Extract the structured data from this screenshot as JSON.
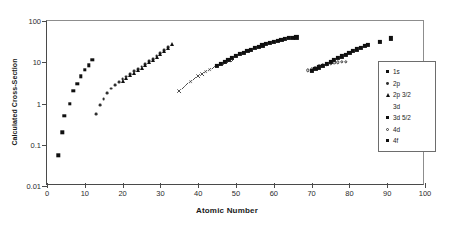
{
  "chart_data": {
    "type": "scatter",
    "title": "",
    "xlabel": "Atomic Number",
    "ylabel": "Calculated Cross-Section",
    "xlim": [
      0,
      100
    ],
    "ylim": [
      0.01,
      100
    ],
    "yscale": "log",
    "xscale": "linear",
    "grid": false,
    "legend_position": "right",
    "xticks": [
      "0",
      "10",
      "20",
      "30",
      "40",
      "50",
      "60",
      "70",
      "80",
      "90",
      "100"
    ],
    "xtick_values": [
      0,
      10,
      20,
      30,
      40,
      50,
      60,
      70,
      80,
      90,
      100
    ],
    "yticks": [
      "0.01",
      "0.1",
      "1",
      "10",
      "100"
    ],
    "ytick_values": [
      0.01,
      0.1,
      1,
      10,
      100
    ],
    "series": [
      {
        "name": "1s",
        "marker": "filled-square",
        "points": [
          [
            3,
            0.055
          ],
          [
            4,
            0.2
          ],
          [
            4.6,
            0.5
          ],
          [
            6,
            1.0
          ],
          [
            7,
            2.0
          ],
          [
            8,
            3.0
          ],
          [
            9,
            4.6
          ],
          [
            10,
            6.5
          ],
          [
            11,
            8.5
          ],
          [
            12,
            11.5
          ]
        ]
      },
      {
        "name": "2p",
        "marker": "small-dot",
        "points": [
          [
            13,
            0.55
          ],
          [
            14,
            0.9
          ],
          [
            15,
            1.3
          ],
          [
            16,
            1.8
          ],
          [
            17,
            2.3
          ],
          [
            18,
            2.8
          ],
          [
            19,
            3.3
          ],
          [
            20,
            3.9
          ],
          [
            21,
            4.5
          ],
          [
            22,
            5.2
          ],
          [
            23,
            6.0
          ],
          [
            24,
            6.8
          ],
          [
            25,
            7.8
          ],
          [
            26,
            9.0
          ],
          [
            27,
            10.5
          ],
          [
            28,
            12.0
          ],
          [
            29,
            14.0
          ],
          [
            30,
            16.5
          ],
          [
            31,
            19.5
          ],
          [
            32,
            23.0
          ]
        ]
      },
      {
        "name": "2p 3/2",
        "marker": "filled-triangle",
        "points": [
          [
            20,
            3.6
          ],
          [
            21,
            4.2
          ],
          [
            22,
            4.9
          ],
          [
            23,
            5.6
          ],
          [
            24,
            6.4
          ],
          [
            25,
            7.3
          ],
          [
            26,
            8.5
          ],
          [
            27,
            10.0
          ],
          [
            28,
            11.5
          ],
          [
            29,
            13.5
          ],
          [
            30,
            16.0
          ],
          [
            31,
            19.0
          ],
          [
            32,
            22.0
          ],
          [
            33,
            27.0
          ]
        ]
      },
      {
        "name": "3d",
        "marker": "x-cross",
        "points": [
          [
            35,
            2.0
          ],
          [
            36,
            2.4
          ],
          [
            37,
            2.9
          ],
          [
            38,
            3.4
          ],
          [
            39,
            4.0
          ],
          [
            40,
            4.6
          ],
          [
            41,
            5.2
          ],
          [
            42,
            5.9
          ],
          [
            43,
            6.6
          ],
          [
            44,
            7.4
          ],
          [
            45,
            8.2
          ],
          [
            46,
            9.0
          ],
          [
            47,
            9.6
          ],
          [
            48,
            10.2
          ],
          [
            49,
            10.8
          ]
        ]
      },
      {
        "name": "3d 5/2",
        "marker": "filled-square",
        "points": [
          [
            45,
            8.2
          ],
          [
            46,
            9.2
          ],
          [
            47,
            10.3
          ],
          [
            48,
            11.5
          ],
          [
            49,
            12.8
          ],
          [
            50,
            14.2
          ],
          [
            51,
            15.6
          ],
          [
            52,
            17.0
          ],
          [
            53,
            18.6
          ],
          [
            54,
            20.2
          ],
          [
            55,
            22.0
          ],
          [
            56,
            23.8
          ],
          [
            57,
            25.6
          ],
          [
            58,
            27.4
          ],
          [
            59,
            29.5
          ],
          [
            60,
            31.5
          ],
          [
            61,
            33.5
          ],
          [
            62,
            35.5
          ],
          [
            63,
            37.0
          ],
          [
            64,
            38.5
          ],
          [
            65,
            39.5
          ],
          [
            66,
            40.0
          ]
        ]
      },
      {
        "name": "4d",
        "marker": "open-circle",
        "points": [
          [
            69,
            6.4
          ],
          [
            70,
            6.9
          ],
          [
            71,
            7.4
          ],
          [
            72,
            7.9
          ],
          [
            73,
            8.4
          ],
          [
            74,
            8.8
          ],
          [
            75,
            9.2
          ],
          [
            76,
            9.6
          ],
          [
            77,
            9.9
          ],
          [
            78,
            10.2
          ],
          [
            79,
            10.4
          ]
        ]
      },
      {
        "name": "4f",
        "marker": "filled-square",
        "points": [
          [
            70,
            6.2
          ],
          [
            71,
            6.8
          ],
          [
            72,
            7.5
          ],
          [
            73,
            8.3
          ],
          [
            74,
            9.2
          ],
          [
            75,
            10.2
          ],
          [
            76,
            11.3
          ],
          [
            77,
            12.5
          ],
          [
            78,
            13.8
          ],
          [
            79,
            15.2
          ],
          [
            80,
            16.8
          ],
          [
            81,
            18.5
          ],
          [
            82,
            20.5
          ],
          [
            83,
            22.5
          ],
          [
            84,
            24.5
          ],
          [
            85,
            26.5
          ],
          [
            88,
            31.0
          ],
          [
            91,
            38.0
          ]
        ]
      }
    ]
  },
  "legend": {
    "items": [
      {
        "label": "1s",
        "marker": "filled-square"
      },
      {
        "label": "2p",
        "marker": "small-dot"
      },
      {
        "label": "2p 3/2",
        "marker": "filled-triangle"
      },
      {
        "label": "3d",
        "marker": "x-cross"
      },
      {
        "label": "3d 5/2",
        "marker": "filled-square"
      },
      {
        "label": "4d",
        "marker": "open-circle"
      },
      {
        "label": "4f",
        "marker": "filled-square"
      }
    ]
  },
  "colors": {
    "axis": "#4a4a4a",
    "marker": "#101010",
    "text": "#1a1a1a"
  }
}
